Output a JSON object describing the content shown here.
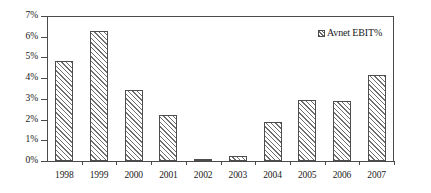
{
  "chart_data": {
    "type": "bar",
    "title": "",
    "subtitle": "",
    "xlabel": "",
    "ylabel": "",
    "categories": [
      "1998",
      "1999",
      "2000",
      "2001",
      "2002",
      "2003",
      "2004",
      "2005",
      "2006",
      "2007"
    ],
    "series": [
      {
        "name": "Avnet EBIT%",
        "values": [
          4.85,
          6.3,
          3.45,
          2.2,
          0.05,
          0.25,
          1.9,
          2.95,
          2.9,
          4.15
        ]
      }
    ],
    "values": [
      4.85,
      6.3,
      3.45,
      2.2,
      0.05,
      0.25,
      1.9,
      2.95,
      2.9,
      4.15
    ],
    "ylim": [
      0,
      7
    ],
    "ytick_values": [
      0,
      1,
      2,
      3,
      4,
      5,
      6,
      7
    ],
    "ytick_labels": [
      "0%",
      "1%",
      "2%",
      "3%",
      "4%",
      "5%",
      "6%",
      "7%"
    ],
    "xtick_labels": [
      "1998",
      "1999",
      "2000",
      "2001",
      "2002",
      "2003",
      "2004",
      "2005",
      "2006",
      "2007"
    ],
    "grid": false,
    "legend": {
      "entries": [
        "Avnet EBIT%"
      ],
      "position": "top-right",
      "marker": "hatched-square-swatch"
    },
    "annotations": [],
    "colors": {
      "bar_fill": "#ffffff",
      "bar_hatch": "#6e6e6e",
      "bar_outline": "#4d4d4d",
      "axis": "#4a4a4a",
      "text": "#1a1a1a",
      "background": "#ffffff"
    }
  },
  "legend": {
    "label": "Avnet EBIT%"
  },
  "axes": {
    "y": {
      "labels": [
        "7%",
        "6%",
        "5%",
        "4%",
        "3%",
        "2%",
        "1%",
        "0%"
      ]
    },
    "x": {
      "labels": [
        "1998",
        "1999",
        "2000",
        "2001",
        "2002",
        "2003",
        "2004",
        "2005",
        "2006",
        "2007"
      ]
    }
  }
}
